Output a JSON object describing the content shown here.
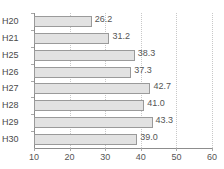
{
  "chart_data": {
    "type": "bar",
    "orientation": "horizontal",
    "title": "",
    "xlabel": "",
    "ylabel": "",
    "categories": [
      "H20",
      "H21",
      "H25",
      "H26",
      "H27",
      "H28",
      "H29",
      "H30"
    ],
    "values": [
      26.2,
      31.2,
      38.3,
      37.3,
      42.7,
      41.0,
      43.3,
      39.0
    ],
    "value_labels": [
      "26.2",
      "31.2",
      "38.3",
      "37.3",
      "42.7",
      "41.0",
      "43.3",
      "39.0"
    ],
    "xlim": [
      10,
      60
    ],
    "xticks": [
      10,
      20,
      30,
      40,
      50,
      60
    ],
    "xtick_labels": [
      "10",
      "20",
      "30",
      "40",
      "50",
      "60"
    ],
    "grid": true,
    "grid_axis": "x",
    "grid_style": "dotted",
    "legend": false,
    "bar_fill_color": "#e2e2e2",
    "bar_border_color": "#9a9a9a",
    "axis_color": "#8d8d8d",
    "grid_color": "#c8c8c8",
    "text_color": "#4a4a4a"
  }
}
